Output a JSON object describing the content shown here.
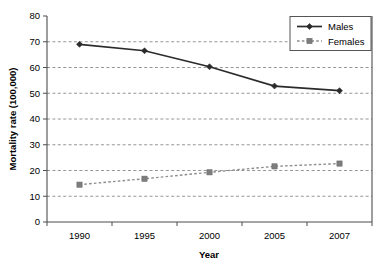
{
  "chart_data": {
    "type": "line",
    "title": "",
    "xlabel": "Year",
    "ylabel": "Mortality rate (100,000)",
    "categories": [
      "1990",
      "1995",
      "2000",
      "2005",
      "2007"
    ],
    "ylim": [
      0,
      80
    ],
    "yticks": [
      "0",
      "10",
      "20",
      "30",
      "40",
      "50",
      "60",
      "70",
      "80"
    ],
    "ytick_values": [
      0,
      10,
      20,
      30,
      40,
      50,
      60,
      70,
      80
    ],
    "grid": "horizontal dashed gridlines only",
    "legend_position": "top-right inside plot",
    "series": [
      {
        "name": "Males",
        "values": [
          69.0,
          66.5,
          60.3,
          52.8,
          51.0
        ],
        "color": "#2b2b2b",
        "linestyle": "solid",
        "marker": "diamond"
      },
      {
        "name": "Females",
        "values": [
          14.5,
          16.8,
          19.3,
          21.6,
          22.7
        ],
        "color": "#8d8d8d",
        "linestyle": "dashed",
        "marker": "square"
      }
    ]
  },
  "legend": {
    "items": [
      {
        "label": "Males"
      },
      {
        "label": "Females"
      }
    ]
  },
  "axes": {
    "x_title": "Year",
    "y_title": "Mortality rate (100,000)"
  }
}
